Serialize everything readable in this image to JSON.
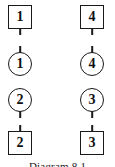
{
  "figure": {
    "caption": "Diagram 8.1",
    "background_color": "#ffffff",
    "stroke_color": "#1a1a1a",
    "text_color": "#101010"
  },
  "diagram_data": {
    "type": "node-diagram",
    "columns": 2,
    "rows": 4,
    "nodes": [
      {
        "id": "sq-1",
        "shape": "square",
        "label": "1",
        "column": "left",
        "row": 1,
        "stub": "down",
        "x": 8,
        "y": 5
      },
      {
        "id": "sq-4",
        "shape": "square",
        "label": "4",
        "column": "right",
        "row": 1,
        "stub": "down",
        "x": 80,
        "y": 5
      },
      {
        "id": "ci-1",
        "shape": "circle",
        "label": "1",
        "column": "left",
        "row": 2,
        "stub": "up",
        "x": 8,
        "y": 52
      },
      {
        "id": "ci-4",
        "shape": "circle",
        "label": "4",
        "column": "right",
        "row": 2,
        "stub": "up",
        "x": 80,
        "y": 52
      },
      {
        "id": "ci-2",
        "shape": "circle",
        "label": "2",
        "column": "left",
        "row": 3,
        "stub": "down",
        "x": 8,
        "y": 88
      },
      {
        "id": "ci-3",
        "shape": "circle",
        "label": "3",
        "column": "right",
        "row": 3,
        "stub": "down",
        "x": 80,
        "y": 88
      },
      {
        "id": "sq-2",
        "shape": "square",
        "label": "2",
        "column": "left",
        "row": 4,
        "stub": "up",
        "x": 8,
        "y": 131
      },
      {
        "id": "sq-3",
        "shape": "square",
        "label": "3",
        "column": "right",
        "row": 4,
        "stub": "up",
        "x": 80,
        "y": 131
      }
    ]
  }
}
